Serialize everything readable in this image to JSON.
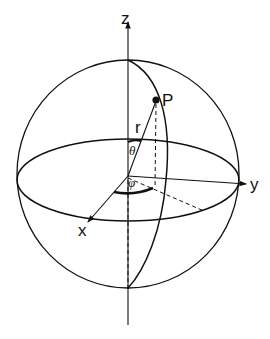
{
  "diagram": {
    "axes": {
      "z": "z",
      "y": "y",
      "x": "x"
    },
    "point": "P",
    "radius": "r",
    "polar_angle": "θ",
    "azimuth_angle": "φ",
    "colors": {
      "stroke": "#111111",
      "background": "#ffffff"
    }
  }
}
